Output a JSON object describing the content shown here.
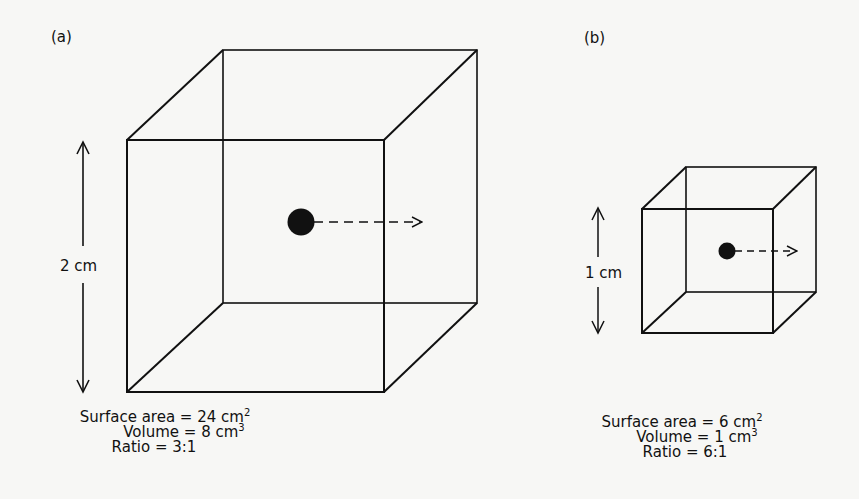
{
  "panels": [
    {
      "id": "a",
      "label": "(a)",
      "dimension_label": "2 cm",
      "stats": {
        "surface_area_label": "Surface area = 24 cm",
        "surface_area_exp": "2",
        "volume_label": "Volume =  8 cm",
        "volume_exp": "3",
        "ratio_label": "Ratio = 3:1"
      }
    },
    {
      "id": "b",
      "label": "(b)",
      "dimension_label": "1 cm",
      "stats": {
        "surface_area_label": "Surface area = 6 cm",
        "surface_area_exp": "2",
        "volume_label": "Volume = 1 cm",
        "volume_exp": "3",
        "ratio_label": "Ratio = 6:1"
      }
    }
  ],
  "colors": {
    "ink": "#111111",
    "paper": "#f7f7f5"
  }
}
